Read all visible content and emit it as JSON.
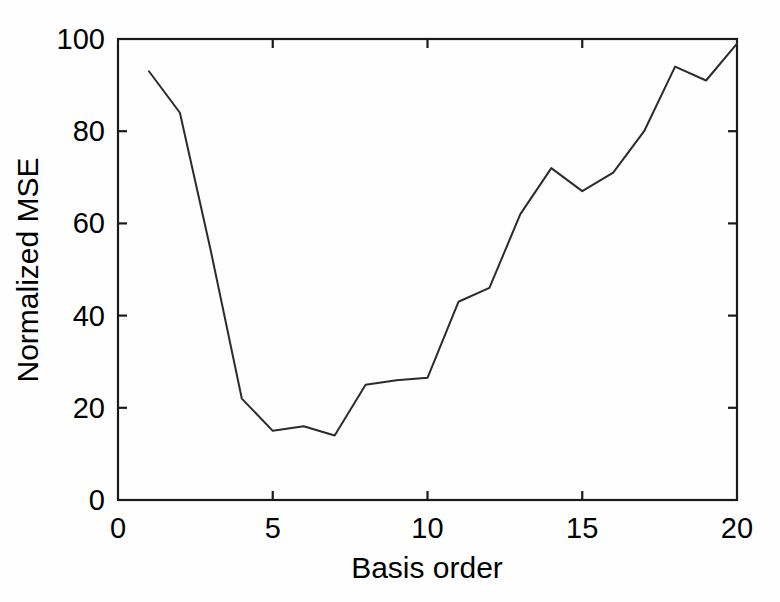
{
  "figure": {
    "background_color": "#fefefe",
    "line_color": "#2b2b2b",
    "axis_color": "#1a1a1a"
  },
  "chart_data": {
    "type": "line",
    "title": "",
    "xlabel": "Basis order",
    "ylabel": "Normalized MSE",
    "xlim": [
      0,
      20
    ],
    "ylim": [
      0,
      100
    ],
    "xticks": [
      0,
      5,
      10,
      15,
      20
    ],
    "xtick_labels": [
      "0",
      "5",
      "10",
      "15",
      "20"
    ],
    "yticks": [
      0,
      20,
      40,
      60,
      80,
      100
    ],
    "ytick_labels": [
      "0",
      "20",
      "40",
      "60",
      "80",
      "100"
    ],
    "grid": false,
    "legend": null,
    "x": [
      1,
      2,
      3,
      4,
      5,
      6,
      7,
      8,
      9,
      10,
      11,
      12,
      13,
      14,
      15,
      16,
      17,
      18,
      19,
      20
    ],
    "values": [
      93,
      84,
      54,
      22,
      15,
      16,
      14,
      25,
      26,
      26.5,
      43,
      46,
      62,
      72,
      67,
      71,
      80,
      94,
      91,
      99
    ],
    "series": [
      {
        "name": "Normalized MSE",
        "values": [
          93,
          84,
          54,
          22,
          15,
          16,
          14,
          25,
          26,
          26.5,
          43,
          46,
          62,
          72,
          67,
          71,
          80,
          94,
          91,
          99
        ]
      }
    ]
  }
}
